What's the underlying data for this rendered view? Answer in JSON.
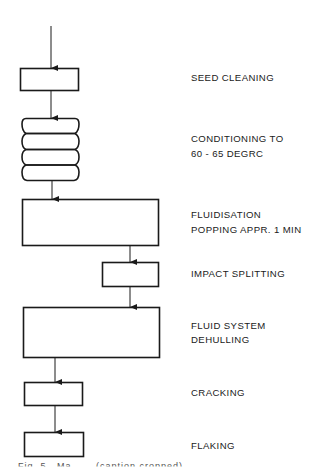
{
  "diagram": {
    "type": "process flow chart",
    "line_color": "#1a1a1a",
    "steps": [
      {
        "id": "seed-cleaning",
        "label": "SEED CLEANING",
        "shape": "rectangle"
      },
      {
        "id": "conditioning",
        "label_line1": "CONDITIONING TO",
        "label_line2": "60 - 65 DEGRC",
        "shape": "stacked-drum"
      },
      {
        "id": "fluidisation",
        "label_line1": "FLUIDISATION",
        "label_line2": "POPPING APPR. 1 MIN",
        "shape": "rectangle"
      },
      {
        "id": "impact-splitting",
        "label": "IMPACT SPLITTING",
        "shape": "rectangle"
      },
      {
        "id": "fluid-dehulling",
        "label_line1": "FLUID SYSTEM",
        "label_line2": "DEHULLING",
        "shape": "rectangle"
      },
      {
        "id": "cracking",
        "label": "CRACKING",
        "shape": "rectangle"
      },
      {
        "id": "flaking",
        "label": "FLAKING",
        "shape": "rectangle"
      }
    ],
    "caption": "Fig. 5.  Ma  ...  (caption cropped)"
  }
}
